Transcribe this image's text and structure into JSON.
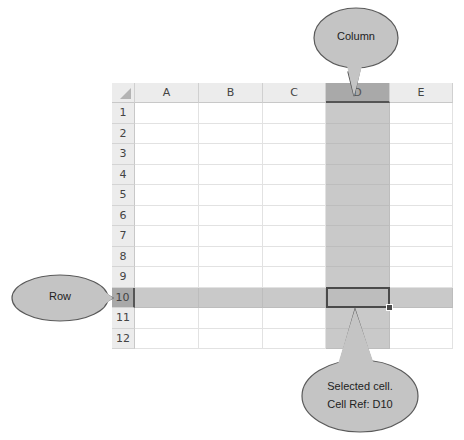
{
  "spreadsheet": {
    "columns": [
      "A",
      "B",
      "C",
      "D",
      "E"
    ],
    "rows": [
      "1",
      "2",
      "3",
      "4",
      "5",
      "6",
      "7",
      "8",
      "9",
      "10",
      "11",
      "12"
    ],
    "selected_column": "D",
    "selected_row": "10",
    "active_cell": "D10"
  },
  "callouts": {
    "column": "Column",
    "row": "Row",
    "cell_line1": "Selected cell.",
    "cell_line2": "Cell Ref: D10"
  },
  "colors": {
    "callout_fill": "#c4c4c4",
    "callout_stroke": "#5a5a5a",
    "highlight": "#c9c9c9",
    "header_selected": "#a9a9a9"
  }
}
